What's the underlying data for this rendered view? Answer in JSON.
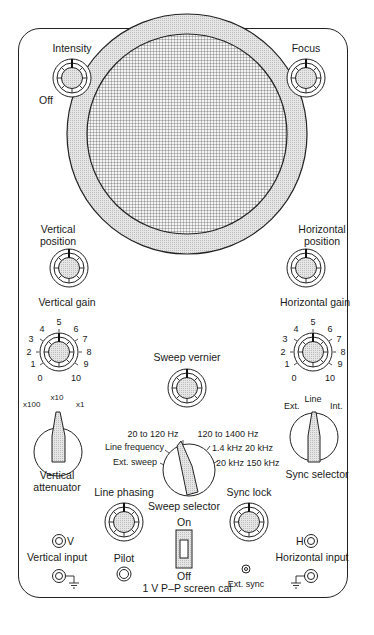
{
  "colors": {
    "ink": "#1a1a1a",
    "knob_fill": "#d9d9d9",
    "bezel": "#e2e2e2",
    "grid": "#555555",
    "background": "#ffffff"
  },
  "controls": {
    "intensity": {
      "label": "Intensity",
      "off_label": "Off"
    },
    "focus": {
      "label": "Focus"
    },
    "vertical_position": {
      "label_line1": "Vertical",
      "label_line2": "position"
    },
    "vertical_gain": {
      "label": "Vertical gain",
      "scale": [
        "0",
        "1",
        "2",
        "3",
        "4",
        "5",
        "6",
        "7",
        "8",
        "9",
        "10"
      ]
    },
    "horizontal_position": {
      "label_line1": "Horizontal",
      "label_line2": "position"
    },
    "horizontal_gain": {
      "label": "Horizontal gain",
      "scale": [
        "0",
        "1",
        "2",
        "3",
        "4",
        "5",
        "6",
        "7",
        "8",
        "9",
        "10"
      ]
    },
    "sweep_vernier": {
      "label": "Sweep vernier"
    },
    "vertical_attenuator": {
      "label_line1": "Vertical",
      "label_line2": "attenuator",
      "positions": [
        "x100",
        "x10",
        "x1"
      ]
    },
    "sweep_selector": {
      "label": "Sweep selector",
      "positions": [
        "Ext. sweep",
        "Line frequency",
        "20 to 120 Hz",
        "120 to 1400 Hz",
        "1.4 kHz 20 kHz",
        "20 kHz 150 kHz"
      ]
    },
    "sync_selector": {
      "label": "Sync selector",
      "positions": [
        "Ext.",
        "Line",
        "Int."
      ]
    },
    "line_phasing": {
      "label": "Line phasing"
    },
    "sync_lock": {
      "label": "Sync lock"
    },
    "power_switch": {
      "on_label": "On",
      "off_label": "Off"
    },
    "screen_cal": {
      "label": "1 V P–P screen cal"
    },
    "pilot": {
      "label": "Pilot"
    },
    "ext_sync": {
      "label": "Ext. sync"
    },
    "vertical_input": {
      "label": "Vertical input",
      "terminal": "V"
    },
    "horizontal_input": {
      "label": "Horizontal input",
      "terminal": "H"
    }
  }
}
